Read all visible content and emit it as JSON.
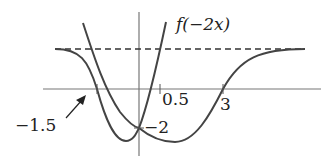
{
  "diagram": {
    "curve_label": "f(−2x)",
    "labels": {
      "neg_one_five": "−1.5",
      "zero_five": "0.5",
      "three": "3",
      "neg_two": "−2"
    },
    "colors": {
      "curve": "#444444",
      "axis": "#666666",
      "text": "#222222"
    }
  }
}
